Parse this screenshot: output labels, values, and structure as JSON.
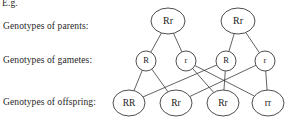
{
  "figure": {
    "intro_label": "E.g.",
    "rows": [
      {
        "key": "parents",
        "label": "Genotypes of parents:"
      },
      {
        "key": "gametes",
        "label": "Genotypes of gametes:"
      },
      {
        "key": "offspring",
        "label": "Genotypes of offspring:"
      }
    ]
  },
  "nodes": {
    "parents": [
      {
        "id": "p1",
        "genotype": "Rr",
        "cx": 168,
        "cy": 21,
        "rx": 17,
        "ry": 13,
        "fontsize": 10
      },
      {
        "id": "p2",
        "genotype": "Rr",
        "cx": 238,
        "cy": 21,
        "rx": 17,
        "ry": 13,
        "fontsize": 10
      }
    ],
    "gametes": [
      {
        "id": "g1",
        "genotype": "R",
        "cx": 146,
        "cy": 61,
        "rx": 10,
        "ry": 10,
        "fontsize": 8.5
      },
      {
        "id": "g2",
        "genotype": "r",
        "cx": 186,
        "cy": 61,
        "rx": 10,
        "ry": 10,
        "fontsize": 8.5
      },
      {
        "id": "g3",
        "genotype": "R",
        "cx": 226,
        "cy": 61,
        "rx": 10,
        "ry": 10,
        "fontsize": 8.5
      },
      {
        "id": "g4",
        "genotype": "r",
        "cx": 265,
        "cy": 61,
        "rx": 10,
        "ry": 10,
        "fontsize": 8.5
      }
    ],
    "offspring": [
      {
        "id": "o1",
        "genotype": "RR",
        "cx": 129,
        "cy": 103,
        "rx": 16,
        "ry": 13,
        "fontsize": 9.5
      },
      {
        "id": "o2",
        "genotype": "Rr",
        "cx": 176,
        "cy": 103,
        "rx": 16,
        "ry": 13,
        "fontsize": 9.5
      },
      {
        "id": "o3",
        "genotype": "Rr",
        "cx": 223,
        "cy": 103,
        "rx": 16,
        "ry": 13,
        "fontsize": 9.5
      },
      {
        "id": "o4",
        "genotype": "rr",
        "cx": 268,
        "cy": 103,
        "rx": 16,
        "ry": 13,
        "fontsize": 9.5
      }
    ]
  },
  "edges": [
    {
      "from": "p1",
      "to": "g1",
      "name": "edge-parent1-gamete-R"
    },
    {
      "from": "p1",
      "to": "g2",
      "name": "edge-parent1-gamete-r"
    },
    {
      "from": "p2",
      "to": "g3",
      "name": "edge-parent2-gamete-R"
    },
    {
      "from": "p2",
      "to": "g4",
      "name": "edge-parent2-gamete-r"
    },
    {
      "from": "g1",
      "to": "o1",
      "name": "edge-gamete1-offspring-RR"
    },
    {
      "from": "g1",
      "to": "o2",
      "name": "edge-gamete1-offspring-Rr"
    },
    {
      "from": "g2",
      "to": "o3",
      "name": "edge-gamete2-offspring-Rr"
    },
    {
      "from": "g2",
      "to": "o4",
      "name": "edge-gamete2-offspring-rr"
    },
    {
      "from": "g3",
      "to": "o1",
      "name": "edge-gamete3-offspring-RR"
    },
    {
      "from": "g3",
      "to": "o3",
      "name": "edge-gamete3-offspring-Rr"
    },
    {
      "from": "g4",
      "to": "o2",
      "name": "edge-gamete4-offspring-Rr"
    },
    {
      "from": "g4",
      "to": "o4",
      "name": "edge-gamete4-offspring-rr"
    }
  ],
  "colors": {
    "stroke": "#3a3a3a",
    "text": "#1a1a1a",
    "background": "#ffffff"
  }
}
